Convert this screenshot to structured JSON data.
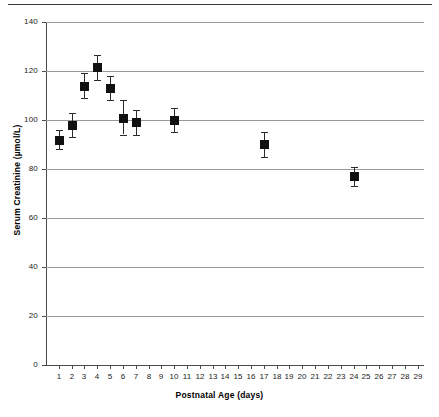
{
  "chart_data": {
    "type": "scatter",
    "title": "",
    "xlabel": "Postnatal Age (days)",
    "ylabel": "Serum Creatinine (µmol/L)",
    "xlim": [
      0,
      29.5
    ],
    "ylim": [
      0,
      140
    ],
    "grid": "horizontal",
    "legend": "none",
    "y_ticks": [
      0,
      20,
      40,
      60,
      80,
      100,
      120,
      140
    ],
    "y_tick_labels": [
      "0",
      "20",
      "40",
      "60",
      "80",
      "100",
      "120",
      "140"
    ],
    "x_ticks": [
      1,
      2,
      3,
      4,
      5,
      6,
      7,
      8,
      9,
      10,
      11,
      12,
      13,
      14,
      15,
      16,
      17,
      18,
      19,
      20,
      21,
      22,
      23,
      24,
      25,
      26,
      27,
      28,
      29
    ],
    "x_tick_labels": [
      "1",
      "2",
      "3",
      "4",
      "5",
      "6",
      "7",
      "8",
      "9",
      "10",
      "11",
      "12",
      "13",
      "14",
      "15",
      "16",
      "17",
      "18",
      "19",
      "20",
      "21",
      "22",
      "23",
      "24",
      "25",
      "26",
      "27",
      "28",
      "29"
    ],
    "marker_style": "filled-square",
    "marker_color": "#111111",
    "errorbar_color": "#2b2b2b",
    "gridline_color": "#9a9a9a",
    "axis_color": "#4a4a4a",
    "series": [
      {
        "name": "Serum creatinine (mean ± SE)",
        "x": [
          1,
          2,
          3,
          4,
          5,
          6,
          7,
          10,
          17,
          24
        ],
        "values": [
          92,
          98,
          114,
          121.5,
          113,
          101,
          99,
          100,
          90,
          77
        ],
        "yerr": [
          4,
          5,
          5,
          5,
          5,
          7,
          5,
          5,
          5,
          4
        ]
      }
    ]
  }
}
